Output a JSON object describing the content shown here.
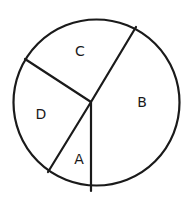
{
  "chart_data": {
    "type": "pie",
    "title": "",
    "categories": [
      "A",
      "B",
      "C",
      "D"
    ],
    "values": [
      9,
      41,
      24,
      25
    ],
    "value_note": "approximate angular share (%) estimated from geometry; no numeric labels shown",
    "legend": "none",
    "labels_inside": true,
    "hub_offset_from_center": true
  },
  "geometry": {
    "circle": {
      "cx": 96.5,
      "cy": 102.5,
      "r": 83
    },
    "hub": {
      "x": 91,
      "y": 102
    },
    "rays": [
      {
        "name": "ray-bottom",
        "x": 91,
        "y": 191
      },
      {
        "name": "ray-up-right",
        "x": 136,
        "y": 27
      },
      {
        "name": "ray-up-left",
        "x": 25,
        "y": 59
      },
      {
        "name": "ray-down-left",
        "x": 48,
        "y": 172
      }
    ],
    "stroke_color": "#1a1a1a",
    "fill_color": "#ffffff",
    "stroke_width": 2.2
  },
  "labels": [
    {
      "text": "C",
      "x": 80,
      "y": 51
    },
    {
      "text": "B",
      "x": 142,
      "y": 102
    },
    {
      "text": "D",
      "x": 41,
      "y": 114
    },
    {
      "text": "A",
      "x": 79,
      "y": 159
    }
  ]
}
